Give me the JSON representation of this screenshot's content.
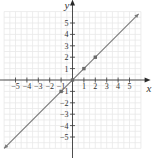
{
  "chart_data": {
    "type": "line",
    "title": "",
    "xlabel": "x",
    "ylabel": "y",
    "xlim": [
      -6.2,
      6.5
    ],
    "ylim": [
      -6,
      6.7
    ],
    "grid": true,
    "legend": "none",
    "x_ticks": [
      -5,
      -4,
      -3,
      -2,
      -1,
      1,
      2,
      3,
      4,
      5
    ],
    "y_ticks": [
      -5,
      -4,
      -3,
      -2,
      -1,
      1,
      2,
      3,
      4,
      5
    ],
    "x_tick_labels": [
      "−5",
      "−4",
      "−3",
      "−2",
      "−1",
      "1",
      "2",
      "3",
      "4",
      "5"
    ],
    "y_tick_labels": [
      "−5",
      "−4",
      "−3",
      "−2",
      "−1",
      "1",
      "2",
      "3",
      "4",
      "5"
    ],
    "series": [
      {
        "name": "y = x",
        "line_x": [
          -6.0,
          5.8
        ],
        "line_y": [
          -6.0,
          5.8
        ],
        "points_x": [
          -1,
          0,
          1,
          2
        ],
        "points_y": [
          -1,
          0,
          1,
          2
        ],
        "color": "#7a7a7a"
      }
    ]
  }
}
